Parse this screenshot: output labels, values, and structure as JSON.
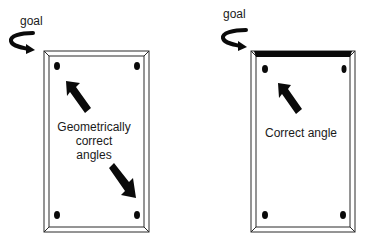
{
  "diagram": {
    "left_panel": {
      "goal_label": "goal",
      "caption_lines": [
        "Geometrically",
        "correct",
        "angles"
      ],
      "top_edge_highlighted": false
    },
    "right_panel": {
      "goal_label": "goal",
      "caption_lines": [
        "Correct angle"
      ],
      "top_edge_highlighted": true
    },
    "colors": {
      "stroke": "#2a2a2a",
      "fill_dark": "#0a0a0a",
      "background": "#ffffff"
    }
  }
}
